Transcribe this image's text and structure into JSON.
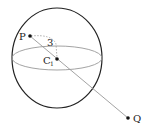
{
  "diagram": {
    "type": "sphere-with-line",
    "sphere": {
      "center": {
        "x": 57,
        "y": 57
      },
      "radius_x": 45,
      "radius_y": 50,
      "outline_color": "#222222",
      "equator_color": "#888888"
    },
    "points": [
      {
        "id": "P",
        "label": "P",
        "x": 30,
        "y": 36
      },
      {
        "id": "C1",
        "label": "C",
        "subscript": "1",
        "x": 57,
        "y": 59
      },
      {
        "id": "Q",
        "label": "Q",
        "x": 128,
        "y": 118
      }
    ],
    "segments": [
      {
        "from": "P",
        "to": "Q",
        "style": "solid",
        "color": "#888888"
      }
    ],
    "annotations": [
      {
        "type": "dashed-arc",
        "from": "P",
        "to": "C1",
        "label": "3"
      }
    ]
  }
}
